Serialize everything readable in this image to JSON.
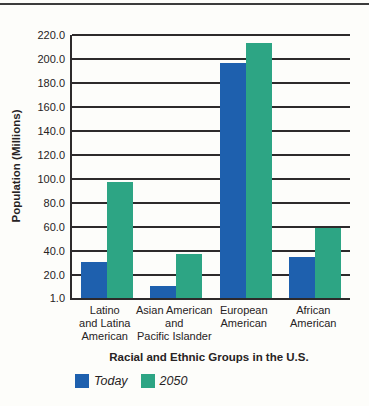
{
  "chart_data": {
    "type": "bar",
    "title": "",
    "categories": [
      "Latino and Latina American",
      "Asian American and Pacific Islander",
      "European American",
      "African American"
    ],
    "category_label_lines": [
      [
        "Latino",
        "and Latina",
        "American"
      ],
      [
        "Asian American",
        "and",
        "Pacific Islander"
      ],
      [
        "European",
        "American"
      ],
      [
        "African",
        "American"
      ]
    ],
    "series": [
      {
        "name": "Today",
        "color": "#1e60ae",
        "values": [
          31,
          11,
          197,
          35
        ]
      },
      {
        "name": "2050",
        "color": "#2da584",
        "values": [
          98,
          38,
          213,
          59
        ]
      }
    ],
    "xlabel": "Racial and Ethnic Groups in the U.S.",
    "ylabel": "Population (Millions)",
    "y_ticks": [
      "220.0",
      "200.0",
      "180.0",
      "160.0",
      "140.0",
      "120.0",
      "100.0",
      "80.0",
      "60.0",
      "40.0",
      "20.0",
      "1.0"
    ],
    "ylim": [
      1.0,
      220.0
    ],
    "grid": true,
    "legend_position": "bottom",
    "axis_color": "#2d2a2b"
  }
}
